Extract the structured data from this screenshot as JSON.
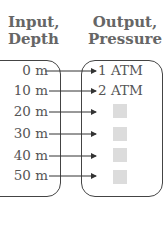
{
  "title_fragment": "Depth and Pressure",
  "input": {
    "header_line1": "Input,",
    "header_line2": "Depth"
  },
  "output": {
    "header_line1": "Output,",
    "header_line2": "Pressure"
  },
  "rows": [
    {
      "input": "0 m",
      "output": "1 ATM"
    },
    {
      "input": "10 m",
      "output": "2 ATM"
    },
    {
      "input": "20 m",
      "output": ""
    },
    {
      "input": "30 m",
      "output": ""
    },
    {
      "input": "40 m",
      "output": ""
    },
    {
      "input": "50 m",
      "output": ""
    }
  ],
  "colors": {
    "line": "#333333",
    "placeholder": "#dcdcdc",
    "text": "#555555"
  }
}
